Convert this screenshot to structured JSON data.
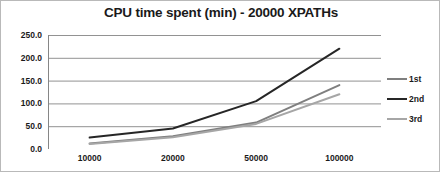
{
  "chart_data": {
    "type": "line",
    "title": "CPU time spent (min) - 20000 XPATHs",
    "xlabel": "",
    "ylabel": "",
    "categories": [
      "10000",
      "20000",
      "50000",
      "100000"
    ],
    "series": [
      {
        "name": "1st",
        "values": [
          12,
          28,
          58,
          140
        ],
        "color": "#7f7f7f"
      },
      {
        "name": "2nd",
        "values": [
          25,
          45,
          105,
          220
        ],
        "color": "#262626"
      },
      {
        "name": "3rd",
        "values": [
          11,
          26,
          55,
          120
        ],
        "color": "#a6a6a6"
      }
    ],
    "ylim": [
      0,
      250
    ],
    "ytick_values": [
      0,
      50,
      100,
      150,
      200,
      250
    ],
    "ytick_labels": [
      "0.0",
      "50.0",
      "100.0",
      "150.0",
      "200.0",
      "250.0"
    ],
    "grid": "horizontal",
    "legend_position": "right",
    "plot_background": "#ffffff",
    "gridline_color": "#868686",
    "axis_color": "#868686",
    "text_color": "#1a1a1a",
    "border_color": "#b9b9b9"
  }
}
